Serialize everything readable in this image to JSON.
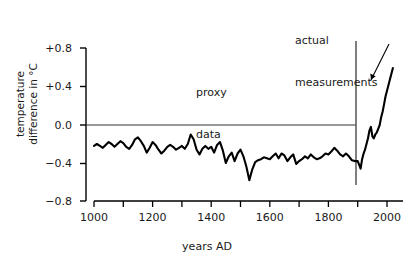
{
  "chart_data": {
    "type": "line",
    "title": "",
    "subtitle": "",
    "xlabel": "years AD",
    "ylabel_lines": [
      "temperature",
      "difference in °C"
    ],
    "ylabel": "temperature difference in °C",
    "xlim": [
      980,
      2030
    ],
    "ylim": [
      -0.8,
      0.8
    ],
    "xticks": [
      1000,
      1100,
      1200,
      1300,
      1400,
      1500,
      1600,
      1700,
      1800,
      1900,
      2000
    ],
    "xtick_labels": [
      "1000",
      "",
      "1200",
      "",
      "1400",
      "",
      "1600",
      "",
      "1800",
      "",
      "2000"
    ],
    "xtick_labels_shown": [
      "1000",
      "1200",
      "1400",
      "1600",
      "1800",
      "2000"
    ],
    "yticks": [
      0.8,
      0.4,
      0.0,
      -0.4,
      -0.8
    ],
    "ytick_labels": [
      "+0.8",
      "+0.4",
      "0.0",
      "−0.4",
      "−0.8"
    ],
    "grid": false,
    "legend": "none",
    "zero_line": {
      "value": 0.0,
      "from_x": 1000,
      "to_x": 1900
    },
    "divider_line": {
      "x": 1900,
      "label": "actual measurements"
    },
    "annotations": [
      {
        "name": "proxy-data",
        "text_lines": [
          "proxy",
          "data"
        ],
        "x": 1380,
        "y": 0.62
      },
      {
        "name": "actual-measurements",
        "text_lines": [
          "actual",
          "measurements"
        ],
        "x": 1900,
        "y": 1.0
      }
    ],
    "arrow": {
      "from_x": 1990,
      "from_y": 0.78,
      "to_x": 1975,
      "to_y": 0.37
    },
    "series": [
      {
        "name": "proxy data",
        "color": "#000000",
        "x": [
          1000,
          1010,
          1020,
          1030,
          1040,
          1050,
          1060,
          1070,
          1080,
          1090,
          1100,
          1110,
          1120,
          1130,
          1140,
          1150,
          1160,
          1170,
          1180,
          1190,
          1200,
          1210,
          1220,
          1230,
          1240,
          1250,
          1260,
          1270,
          1280,
          1290,
          1300,
          1310,
          1320,
          1330,
          1340,
          1350,
          1360,
          1370,
          1380,
          1390,
          1400,
          1410,
          1420,
          1430,
          1440,
          1450,
          1460,
          1470,
          1480,
          1490,
          1500,
          1510,
          1520,
          1530,
          1540,
          1550,
          1560,
          1570,
          1580,
          1590,
          1600,
          1610,
          1620,
          1630,
          1640,
          1650,
          1660,
          1670,
          1680,
          1690,
          1700,
          1710,
          1720,
          1730,
          1740,
          1750,
          1760,
          1770,
          1780,
          1790,
          1800,
          1810,
          1820,
          1830,
          1840,
          1850,
          1860,
          1870,
          1880,
          1890,
          1900
        ],
        "y": [
          -0.22,
          -0.2,
          -0.22,
          -0.24,
          -0.21,
          -0.18,
          -0.2,
          -0.23,
          -0.2,
          -0.17,
          -0.19,
          -0.23,
          -0.25,
          -0.21,
          -0.15,
          -0.13,
          -0.17,
          -0.22,
          -0.29,
          -0.24,
          -0.18,
          -0.21,
          -0.26,
          -0.3,
          -0.27,
          -0.23,
          -0.21,
          -0.23,
          -0.26,
          -0.24,
          -0.22,
          -0.25,
          -0.2,
          -0.1,
          -0.15,
          -0.26,
          -0.31,
          -0.25,
          -0.22,
          -0.25,
          -0.23,
          -0.29,
          -0.21,
          -0.18,
          -0.27,
          -0.4,
          -0.33,
          -0.29,
          -0.38,
          -0.3,
          -0.26,
          -0.33,
          -0.44,
          -0.58,
          -0.47,
          -0.39,
          -0.37,
          -0.36,
          -0.34,
          -0.35,
          -0.36,
          -0.33,
          -0.3,
          -0.35,
          -0.3,
          -0.32,
          -0.38,
          -0.34,
          -0.31,
          -0.41,
          -0.38,
          -0.36,
          -0.33,
          -0.35,
          -0.31,
          -0.34,
          -0.36,
          -0.35,
          -0.33,
          -0.3,
          -0.31,
          -0.28,
          -0.24,
          -0.27,
          -0.31,
          -0.33,
          -0.3,
          -0.33,
          -0.37,
          -0.38,
          -0.38
        ]
      },
      {
        "name": "actual measurements",
        "color": "#000000",
        "x": [
          1900,
          1905,
          1910,
          1915,
          1920,
          1925,
          1930,
          1935,
          1940,
          1945,
          1950,
          1955,
          1960,
          1965,
          1970,
          1975,
          1980,
          1985,
          1990,
          1995,
          2000,
          2005,
          2010,
          2015,
          2020
        ],
        "y": [
          -0.38,
          -0.42,
          -0.46,
          -0.36,
          -0.3,
          -0.26,
          -0.2,
          -0.14,
          -0.06,
          -0.02,
          -0.12,
          -0.14,
          -0.1,
          -0.08,
          -0.04,
          0.0,
          0.08,
          0.14,
          0.22,
          0.3,
          0.36,
          0.42,
          0.48,
          0.54,
          0.6
        ]
      }
    ]
  },
  "axes": {
    "ytick_labels": [
      "+0.8",
      "+0.4",
      "0.0",
      "−0.4",
      "−0.8"
    ],
    "xtick_labels": [
      "1000",
      "1200",
      "1400",
      "1600",
      "1800",
      "2000"
    ],
    "xlabel": "years AD",
    "ylabel_line1": "temperature",
    "ylabel_line2": "difference in °C"
  },
  "annotations": {
    "proxy_line1": "proxy",
    "proxy_line2": "data",
    "actual_line1": "actual",
    "actual_line2": "measurements"
  },
  "colors": {
    "line": "#000000",
    "axis": "#000000",
    "divider": "#555555",
    "background": "#ffffff",
    "text": "#1a1a1a"
  }
}
